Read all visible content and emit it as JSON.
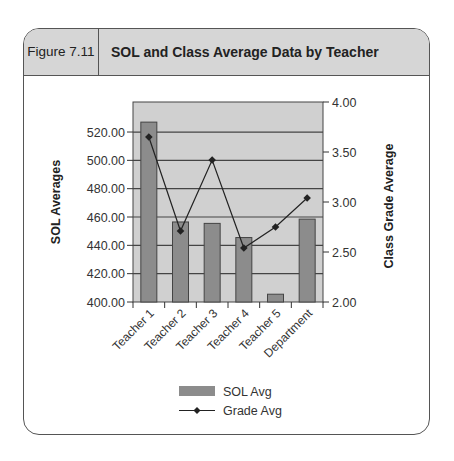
{
  "figure": {
    "label": "Figure 7.11",
    "title": "SOL and Class Average Data by Teacher"
  },
  "colors": {
    "plot_background": "#d0d0d0",
    "bar_fill": "#8c8c8c",
    "bar_stroke": "#444444",
    "line": "#222222",
    "header_background": "#d6d6d6",
    "gridline": "#444444"
  },
  "chart_data": {
    "type": "bar",
    "title": "SOL and Class Average Data by Teacher",
    "categories": [
      "Teacher 1",
      "Teacher 2",
      "Teacher 3",
      "Teacher 4",
      "Teacher 5",
      "Department"
    ],
    "series": [
      {
        "name": "SOL Avg",
        "type": "bar",
        "axis": "left",
        "values": [
          527,
          456.5,
          455.5,
          445.5,
          405.5,
          458.5
        ]
      },
      {
        "name": "Grade Avg",
        "type": "line",
        "axis": "right",
        "marker": "diamond",
        "values": [
          3.65,
          2.71,
          3.42,
          2.54,
          2.75,
          3.04
        ]
      }
    ],
    "ylabel": "SOL Averages",
    "y2label": "Class Grade Average",
    "xlabel": "",
    "ylim": [
      400,
      541.2
    ],
    "y2lim": [
      2.0,
      4.0
    ],
    "yticks": [
      "400.00",
      "420.00",
      "440.00",
      "460.00",
      "480.00",
      "500.00",
      "520.00"
    ],
    "y2ticks": [
      "2.00",
      "2.50",
      "3.00",
      "3.50",
      "4.00"
    ],
    "grid": true,
    "legend_position": "bottom"
  },
  "legend": {
    "bar_label": "SOL Avg",
    "line_label": "Grade Avg"
  }
}
